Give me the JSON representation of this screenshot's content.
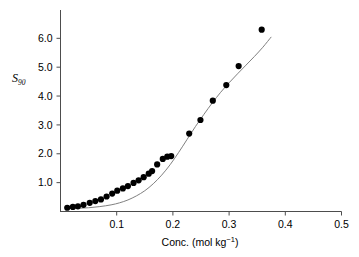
{
  "chart_data": {
    "type": "scatter",
    "title": "",
    "xlabel": "Conc. (mol kg⁻¹)",
    "ylabel": "S90",
    "ylabel_base": "S",
    "ylabel_sub": "90",
    "xlabel_prefix": "Conc. (mol kg",
    "xlabel_exponent": "−1",
    "xlabel_suffix": ")",
    "xlim": [
      0.0,
      0.5
    ],
    "ylim": [
      0.0,
      6.6
    ],
    "xticks": [
      0.1,
      0.2,
      0.3,
      0.4,
      0.5
    ],
    "xtick_labels": [
      "0.1",
      "0.2",
      "0.3",
      "0.4",
      "0.5"
    ],
    "yticks": [
      1.0,
      2.0,
      3.0,
      4.0,
      5.0,
      6.0
    ],
    "ytick_labels": [
      "1.0",
      "2.0",
      "3.0",
      "4.0",
      "5.0",
      "6.0"
    ],
    "grid": false,
    "legend": false,
    "legend_position": "none",
    "marker": "filled-circle",
    "marker_color": "#000000",
    "curve_color": "#808080",
    "axis_color": "#4d4d4d",
    "background_color": "#ffffff",
    "spines_visible": [
      "left",
      "bottom"
    ],
    "series": [
      {
        "name": "measured",
        "type": "scatter",
        "points": [
          [
            0.012,
            0.13
          ],
          [
            0.022,
            0.16
          ],
          [
            0.031,
            0.18
          ],
          [
            0.041,
            0.23
          ],
          [
            0.052,
            0.3
          ],
          [
            0.062,
            0.36
          ],
          [
            0.072,
            0.42
          ],
          [
            0.082,
            0.52
          ],
          [
            0.092,
            0.62
          ],
          [
            0.101,
            0.72
          ],
          [
            0.111,
            0.8
          ],
          [
            0.12,
            0.88
          ],
          [
            0.13,
            0.99
          ],
          [
            0.139,
            1.08
          ],
          [
            0.148,
            1.19
          ],
          [
            0.157,
            1.31
          ],
          [
            0.163,
            1.4
          ],
          [
            0.172,
            1.63
          ],
          [
            0.182,
            1.82
          ],
          [
            0.19,
            1.9
          ],
          [
            0.197,
            1.92
          ],
          [
            0.229,
            2.7
          ],
          [
            0.249,
            3.17
          ],
          [
            0.271,
            3.84
          ],
          [
            0.295,
            4.38
          ],
          [
            0.317,
            5.04
          ],
          [
            0.358,
            6.3
          ]
        ]
      },
      {
        "name": "fitted-curve",
        "type": "line",
        "points": [
          [
            0.01,
            0.1
          ],
          [
            0.03,
            0.11
          ],
          [
            0.05,
            0.13
          ],
          [
            0.07,
            0.17
          ],
          [
            0.09,
            0.23
          ],
          [
            0.105,
            0.3
          ],
          [
            0.12,
            0.4
          ],
          [
            0.135,
            0.54
          ],
          [
            0.15,
            0.72
          ],
          [
            0.165,
            0.96
          ],
          [
            0.18,
            1.26
          ],
          [
            0.195,
            1.62
          ],
          [
            0.21,
            2.04
          ],
          [
            0.225,
            2.49
          ],
          [
            0.24,
            2.94
          ],
          [
            0.255,
            3.36
          ],
          [
            0.27,
            3.76
          ],
          [
            0.285,
            4.13
          ],
          [
            0.3,
            4.46
          ],
          [
            0.315,
            4.77
          ],
          [
            0.33,
            5.07
          ],
          [
            0.345,
            5.37
          ],
          [
            0.36,
            5.69
          ],
          [
            0.375,
            6.05
          ]
        ]
      }
    ]
  }
}
